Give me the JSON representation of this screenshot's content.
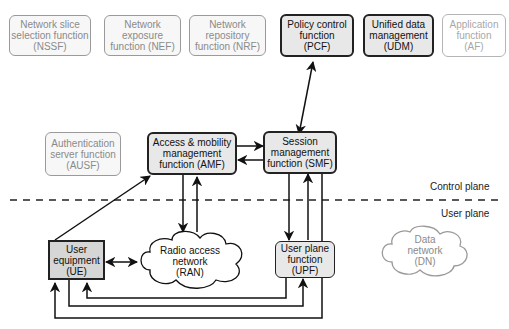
{
  "diagram": {
    "top_functions": [
      {
        "id": "nssf",
        "label": "Network slice\nselection function\n(NSSF)"
      },
      {
        "id": "nef",
        "label": "Network\nexposure\nfunction (NEF)"
      },
      {
        "id": "nrf",
        "label": "Network\nrepository\nfunction (NRF)"
      },
      {
        "id": "pcf",
        "label": "Policy control\nfunction\n(PCF)"
      },
      {
        "id": "udm",
        "label": "Unified data\nmanagement\n(UDM)"
      },
      {
        "id": "af",
        "label": "Application\nfunction\n(AF)"
      }
    ],
    "ausf": {
      "label": "Authentication\nserver function\n(AUSF)"
    },
    "amf": {
      "label": "Access & mobility\nmanagement\nfunction (AMF)"
    },
    "smf": {
      "label": "Session\nmanagement\nfunction (SMF)"
    },
    "ue": {
      "label": "User\nequipment\n(UE)"
    },
    "ran": {
      "label": "Radio access\nnetwork\n(RAN)"
    },
    "upf": {
      "label": "User plane\nfunction\n(UPF)"
    },
    "dn": {
      "label": "Data\nnetwork\n(DN)"
    },
    "planes": {
      "control": "Control plane",
      "user": "User plane"
    },
    "connections": [
      {
        "from": "PCF",
        "to": "SMF",
        "type": "bidirectional"
      },
      {
        "from": "AMF",
        "to": "SMF",
        "type": "arrow"
      },
      {
        "from": "SMF",
        "to": "AMF",
        "type": "arrow"
      },
      {
        "from": "UE",
        "to": "AMF",
        "type": "arrow"
      },
      {
        "from": "AMF",
        "to": "RAN",
        "type": "arrow"
      },
      {
        "from": "RAN",
        "to": "AMF",
        "type": "arrow"
      },
      {
        "from": "SMF",
        "to": "UPF",
        "type": "arrow"
      },
      {
        "from": "UPF",
        "to": "SMF",
        "type": "arrow"
      },
      {
        "from": "UE",
        "to": "RAN",
        "type": "bidirectional"
      },
      {
        "from": "UPF",
        "to": "UE",
        "type": "arrow"
      },
      {
        "from": "UE",
        "to": "UPF",
        "type": "arrow"
      },
      {
        "from": "SMF",
        "to": "UE",
        "type": "arrow"
      }
    ]
  }
}
